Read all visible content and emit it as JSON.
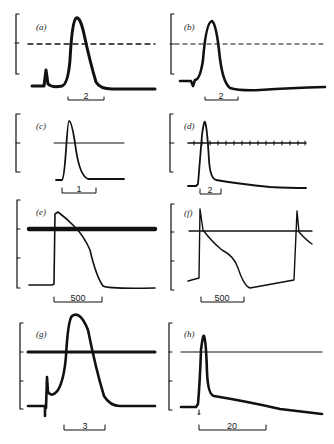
{
  "figure": {
    "panels": [
      {
        "id": "a",
        "label": "(a)",
        "scale_bar": "2",
        "reference_line": "dashed"
      },
      {
        "id": "b",
        "label": "(b)",
        "scale_bar": "2",
        "reference_line": "dashed"
      },
      {
        "id": "c",
        "label": "(c)",
        "scale_bar": "1",
        "reference_line": "solid"
      },
      {
        "id": "d",
        "label": "(d)",
        "scale_bar": "2",
        "reference_line": "ticked"
      },
      {
        "id": "e",
        "label": "(e)",
        "scale_bar": "500",
        "reference_line": "thick"
      },
      {
        "id": "f",
        "label": "(f)",
        "scale_bar": "500",
        "reference_line": "solid"
      },
      {
        "id": "g",
        "label": "(g)",
        "scale_bar": "3",
        "reference_line": "thick"
      },
      {
        "id": "h",
        "label": "(h)",
        "scale_bar": "20",
        "reference_line": "solid"
      }
    ]
  }
}
